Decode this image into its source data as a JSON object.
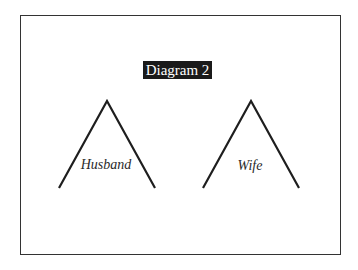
{
  "title": "Diagram 2",
  "colors": {
    "stroke": "#1e1e1e",
    "frame": "#333333",
    "title_bg": "#1a1a1a",
    "title_fg": "#ffffff"
  },
  "nodes": [
    {
      "id": "husband",
      "label": "Husband",
      "apex": [
        107,
        101
      ],
      "left_foot": [
        59,
        188
      ],
      "right_foot": [
        155,
        188
      ],
      "label_pos": [
        106,
        169
      ]
    },
    {
      "id": "wife",
      "label": "Wife",
      "apex": [
        251,
        101
      ],
      "left_foot": [
        203,
        188
      ],
      "right_foot": [
        299,
        188
      ],
      "label_pos": [
        250,
        170
      ]
    }
  ]
}
